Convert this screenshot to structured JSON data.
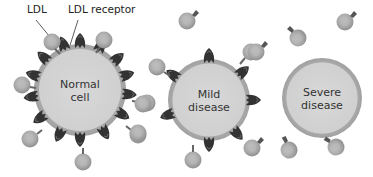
{
  "labels": {
    "ldl": "LDL",
    "ldl_receptor": "LDL receptor"
  },
  "cells": [
    {
      "id": "normal",
      "line1": "Normal",
      "line2": "cell",
      "cx": 80,
      "cy": 90,
      "r": 46,
      "receptors": 16
    },
    {
      "id": "mild",
      "line1": "Mild",
      "line2": "disease",
      "cx": 209,
      "cy": 100,
      "r": 41,
      "receptors": 7
    },
    {
      "id": "severe",
      "line1": "Severe",
      "line2": "disease",
      "cx": 322,
      "cy": 98,
      "r": 40,
      "receptors": 0
    }
  ],
  "colors": {
    "cell_fill": "#d4d4d4",
    "cell_rim": "#a8a8a8",
    "ldl_fill": "#a9a9a9",
    "ldl_core": "#bdbdbd",
    "receptor": "#3a3a3a"
  }
}
